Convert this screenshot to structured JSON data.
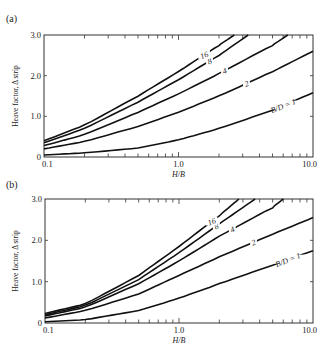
{
  "chart_data": [
    {
      "type": "line",
      "panel_label": "(a)",
      "title": "",
      "xlabel": "H/B",
      "ylabel": "Heave factor, Δ strip",
      "xscale": "log",
      "xlim": [
        0.1,
        10.0
      ],
      "ylim": [
        0,
        3.0
      ],
      "x_tick_labels": [
        "0.1",
        "1.0",
        "10.0"
      ],
      "y_tick_labels": [
        "0",
        "1.0",
        "2.0",
        "3.0"
      ],
      "grid": false,
      "legend": "inline curve labels",
      "series": [
        {
          "name": "B/D = 1",
          "label": "B/D = 1",
          "x": [
            0.1,
            0.2,
            0.5,
            1.0,
            2.0,
            5.0,
            10.0
          ],
          "values": [
            0.05,
            0.1,
            0.22,
            0.42,
            0.7,
            1.15,
            1.58
          ]
        },
        {
          "name": "2",
          "label": "2",
          "x": [
            0.1,
            0.2,
            0.5,
            1.0,
            2.0,
            5.0,
            10.0
          ],
          "values": [
            0.2,
            0.38,
            0.75,
            1.1,
            1.5,
            2.1,
            2.6
          ]
        },
        {
          "name": "4",
          "label": "4",
          "x": [
            0.1,
            0.2,
            0.5,
            1.0,
            2.0,
            5.0,
            6.5
          ],
          "values": [
            0.28,
            0.55,
            1.1,
            1.55,
            2.05,
            2.75,
            3.0
          ]
        },
        {
          "name": "8",
          "label": "8",
          "x": [
            0.1,
            0.2,
            0.5,
            1.0,
            2.0,
            3.3
          ],
          "values": [
            0.35,
            0.7,
            1.35,
            1.9,
            2.5,
            3.0
          ]
        },
        {
          "name": "16",
          "label": "16",
          "x": [
            0.1,
            0.2,
            0.5,
            1.0,
            2.0,
            2.6
          ],
          "values": [
            0.4,
            0.78,
            1.5,
            2.1,
            2.75,
            3.0
          ]
        }
      ]
    },
    {
      "type": "line",
      "panel_label": "(b)",
      "title": "",
      "xlabel": "H/B",
      "ylabel": "Heave factor, Δ strip",
      "xscale": "log",
      "xlim": [
        0.1,
        10.0
      ],
      "ylim": [
        0,
        3.0
      ],
      "x_tick_labels": [
        "0.1",
        "1.0",
        "10.0"
      ],
      "y_tick_labels": [
        "0",
        "1.0",
        "2.0",
        "3.0"
      ],
      "grid": false,
      "legend": "inline curve labels",
      "series": [
        {
          "name": "B/D = 1",
          "label": "B/D = 1",
          "x": [
            0.1,
            0.2,
            0.5,
            1.0,
            2.0,
            5.0,
            10.0
          ],
          "values": [
            0.03,
            0.08,
            0.3,
            0.6,
            0.95,
            1.4,
            1.75
          ]
        },
        {
          "name": "2",
          "label": "2",
          "x": [
            0.1,
            0.2,
            0.5,
            1.0,
            2.0,
            5.0,
            10.0
          ],
          "values": [
            0.12,
            0.3,
            0.7,
            1.15,
            1.6,
            2.15,
            2.55
          ]
        },
        {
          "name": "4",
          "label": "4",
          "x": [
            0.1,
            0.2,
            0.5,
            1.0,
            2.0,
            5.0,
            6.0
          ],
          "values": [
            0.17,
            0.38,
            0.95,
            1.5,
            2.1,
            2.8,
            3.0
          ]
        },
        {
          "name": "8",
          "label": "8",
          "x": [
            0.1,
            0.2,
            0.5,
            1.0,
            2.0,
            3.7
          ],
          "values": [
            0.2,
            0.42,
            1.05,
            1.7,
            2.4,
            3.0
          ]
        },
        {
          "name": "16",
          "label": "16",
          "x": [
            0.1,
            0.2,
            0.5,
            1.0,
            2.0,
            2.8
          ],
          "values": [
            0.23,
            0.46,
            1.15,
            1.85,
            2.6,
            3.0
          ]
        }
      ]
    }
  ]
}
